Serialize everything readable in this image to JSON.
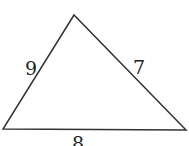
{
  "diagram": {
    "type": "triangle",
    "vertices": {
      "apex": [
        74,
        15
      ],
      "bottom_left": [
        3,
        129
      ],
      "bottom_right": [
        186,
        130
      ]
    },
    "sides": [
      {
        "name": "left",
        "label": "9"
      },
      {
        "name": "right",
        "label": "7"
      },
      {
        "name": "bottom",
        "label": "8"
      }
    ],
    "stroke_color": "#333333"
  }
}
